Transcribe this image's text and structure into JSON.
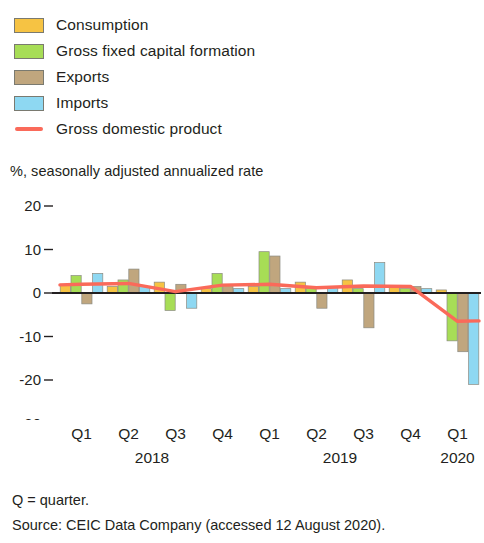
{
  "legend": {
    "items": [
      {
        "label": "Consumption",
        "color": "#f6c343",
        "marker": "swatch"
      },
      {
        "label": "Gross fixed capital formation",
        "color": "#a7dd56",
        "marker": "swatch"
      },
      {
        "label": "Exports",
        "color": "#c0a67e",
        "marker": "swatch"
      },
      {
        "label": "Imports",
        "color": "#8ed8f2",
        "marker": "swatch"
      },
      {
        "label": "Gross domestic product",
        "color": "#fa6a5a",
        "marker": "line"
      }
    ]
  },
  "axis_title": "%, seasonally adjusted annualized rate",
  "footer": {
    "note": "Q = quarter.",
    "source": "Source: CEIC Data Company (accessed 12 August 2020)."
  },
  "chart_data": {
    "type": "bar",
    "title": "",
    "subtitle": "",
    "xlabel": "",
    "ylabel": "%, seasonally adjusted annualized rate",
    "ylim": [
      -32,
      22
    ],
    "yticks": [
      20,
      10,
      0,
      -10,
      -20,
      -30
    ],
    "ytick_labels": [
      "20",
      "10",
      "0",
      "-10",
      "-20",
      "-30"
    ],
    "grid": false,
    "legend_position": "top-left",
    "zero_line": true,
    "categories": [
      "Q1",
      "Q2",
      "Q3",
      "Q4",
      "Q1",
      "Q2",
      "Q3",
      "Q4",
      "Q1"
    ],
    "year_groups": [
      {
        "year": "2018",
        "start": 0,
        "end": 3
      },
      {
        "year": "2019",
        "start": 4,
        "end": 7
      },
      {
        "year": "2020",
        "start": 8,
        "end": 8
      }
    ],
    "series": [
      {
        "name": "Consumption",
        "type": "bar",
        "color": "#f6c343",
        "values": [
          2.0,
          1.5,
          2.5,
          1.0,
          1.5,
          2.5,
          3.0,
          1.5,
          0.7
        ]
      },
      {
        "name": "Gross fixed capital formation",
        "type": "bar",
        "color": "#a7dd56",
        "values": [
          4.0,
          3.0,
          -4.0,
          4.5,
          9.5,
          1.0,
          1.0,
          1.0,
          -11.0
        ]
      },
      {
        "name": "Exports",
        "type": "bar",
        "color": "#c0a67e",
        "values": [
          -2.5,
          5.5,
          2.0,
          2.0,
          8.5,
          -3.5,
          -8.0,
          1.5,
          -13.5
        ]
      },
      {
        "name": "Imports",
        "type": "bar",
        "color": "#8ed8f2",
        "values": [
          4.5,
          1.5,
          -3.5,
          1.0,
          1.0,
          1.5,
          7.0,
          1.0,
          -21.0
        ]
      },
      {
        "name": "Gross domestic product",
        "type": "line",
        "color": "#fa6a5a",
        "values": [
          2.0,
          2.2,
          0.3,
          1.8,
          2.0,
          1.2,
          1.6,
          1.5,
          -6.5
        ]
      }
    ]
  }
}
